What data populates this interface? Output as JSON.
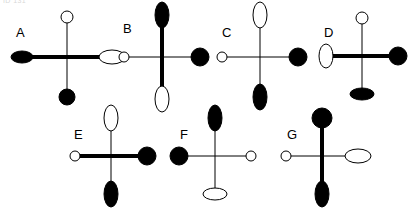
{
  "canvas": {
    "width": 407,
    "height": 213,
    "background": "#ffffff",
    "stroke_color": "#000000",
    "fill_color": "#000000",
    "open_fill": "#ffffff",
    "thin_arm_width": 1,
    "thick_arm_width": 4,
    "top_fragment_text": "ID 131"
  },
  "figures": [
    {
      "id": "A",
      "label": "A",
      "label_x": 16,
      "label_y": 26,
      "center_x": 67,
      "center_y": 57,
      "arm_left": 45,
      "arm_right": 45,
      "arm_up": 40,
      "arm_down": 40,
      "thick_axis": "horizontal",
      "markers": {
        "top": {
          "shape": "circle",
          "fill": "open",
          "orient": "none",
          "rx": 6,
          "ry": 6
        },
        "bottom": {
          "shape": "circle",
          "fill": "filled",
          "orient": "none",
          "rx": 8,
          "ry": 8
        },
        "left": {
          "shape": "ellipse",
          "fill": "filled",
          "orient": "horizontal",
          "rx": 11,
          "ry": 6
        },
        "right": {
          "shape": "ellipse",
          "fill": "open",
          "orient": "horizontal",
          "rx": 13,
          "ry": 7
        }
      }
    },
    {
      "id": "B",
      "label": "B",
      "label_x": 123,
      "label_y": 22,
      "center_x": 162,
      "center_y": 57,
      "arm_left": 38,
      "arm_right": 38,
      "arm_up": 42,
      "arm_down": 42,
      "thick_axis": "vertical",
      "markers": {
        "top": {
          "shape": "ellipse",
          "fill": "filled",
          "orient": "vertical",
          "rx": 7,
          "ry": 13
        },
        "bottom": {
          "shape": "ellipse",
          "fill": "open",
          "orient": "vertical",
          "rx": 7,
          "ry": 13
        },
        "left": {
          "shape": "circle",
          "fill": "open",
          "orient": "none",
          "rx": 5,
          "ry": 5
        },
        "right": {
          "shape": "circle",
          "fill": "filled",
          "orient": "none",
          "rx": 9,
          "ry": 9
        }
      }
    },
    {
      "id": "C",
      "label": "C",
      "label_x": 222,
      "label_y": 26,
      "center_x": 260,
      "center_y": 57,
      "arm_left": 38,
      "arm_right": 38,
      "arm_up": 42,
      "arm_down": 40,
      "thick_axis": "none",
      "markers": {
        "top": {
          "shape": "ellipse",
          "fill": "open",
          "orient": "vertical",
          "rx": 7,
          "ry": 13
        },
        "bottom": {
          "shape": "ellipse",
          "fill": "filled",
          "orient": "vertical",
          "rx": 7,
          "ry": 13
        },
        "left": {
          "shape": "circle",
          "fill": "open",
          "orient": "none",
          "rx": 5,
          "ry": 5
        },
        "right": {
          "shape": "circle",
          "fill": "filled",
          "orient": "none",
          "rx": 9,
          "ry": 9
        }
      }
    },
    {
      "id": "D",
      "label": "D",
      "label_x": 324,
      "label_y": 26,
      "center_x": 362,
      "center_y": 56,
      "arm_left": 36,
      "arm_right": 36,
      "arm_up": 38,
      "arm_down": 38,
      "thick_axis": "horizontal",
      "markers": {
        "top": {
          "shape": "circle",
          "fill": "open",
          "orient": "none",
          "rx": 6,
          "ry": 6
        },
        "bottom": {
          "shape": "ellipse",
          "fill": "filled",
          "orient": "horizontal",
          "rx": 12,
          "ry": 6
        },
        "left": {
          "shape": "ellipse",
          "fill": "open",
          "orient": "vertical",
          "rx": 7,
          "ry": 12
        },
        "right": {
          "shape": "circle",
          "fill": "filled",
          "orient": "none",
          "rx": 9,
          "ry": 9
        }
      }
    },
    {
      "id": "E",
      "label": "E",
      "label_x": 74,
      "label_y": 128,
      "center_x": 111,
      "center_y": 156,
      "arm_left": 36,
      "arm_right": 36,
      "arm_up": 38,
      "arm_down": 38,
      "thick_axis": "horizontal",
      "markers": {
        "top": {
          "shape": "ellipse",
          "fill": "open",
          "orient": "vertical",
          "rx": 7,
          "ry": 13
        },
        "bottom": {
          "shape": "ellipse",
          "fill": "filled",
          "orient": "vertical",
          "rx": 7,
          "ry": 13
        },
        "left": {
          "shape": "circle",
          "fill": "open",
          "orient": "none",
          "rx": 5,
          "ry": 5
        },
        "right": {
          "shape": "circle",
          "fill": "filled",
          "orient": "none",
          "rx": 9,
          "ry": 9
        }
      }
    },
    {
      "id": "F",
      "label": "F",
      "label_x": 180,
      "label_y": 128,
      "center_x": 215,
      "center_y": 156,
      "arm_left": 36,
      "arm_right": 36,
      "arm_up": 38,
      "arm_down": 38,
      "thick_axis": "none",
      "markers": {
        "top": {
          "shape": "ellipse",
          "fill": "filled",
          "orient": "vertical",
          "rx": 7,
          "ry": 13
        },
        "bottom": {
          "shape": "ellipse",
          "fill": "open",
          "orient": "horizontal",
          "rx": 12,
          "ry": 6
        },
        "left": {
          "shape": "circle",
          "fill": "filled",
          "orient": "none",
          "rx": 9,
          "ry": 9
        },
        "right": {
          "shape": "circle",
          "fill": "open",
          "orient": "none",
          "rx": 5,
          "ry": 5
        }
      }
    },
    {
      "id": "G",
      "label": "G",
      "label_x": 287,
      "label_y": 128,
      "center_x": 322,
      "center_y": 156,
      "arm_left": 36,
      "arm_right": 36,
      "arm_up": 38,
      "arm_down": 38,
      "thick_axis": "vertical",
      "markers": {
        "top": {
          "shape": "circle",
          "fill": "filled",
          "orient": "none",
          "rx": 10,
          "ry": 10
        },
        "bottom": {
          "shape": "ellipse",
          "fill": "filled",
          "orient": "vertical",
          "rx": 7,
          "ry": 13
        },
        "left": {
          "shape": "circle",
          "fill": "open",
          "orient": "none",
          "rx": 5,
          "ry": 5
        },
        "right": {
          "shape": "ellipse",
          "fill": "open",
          "orient": "horizontal",
          "rx": 13,
          "ry": 7
        }
      }
    }
  ]
}
